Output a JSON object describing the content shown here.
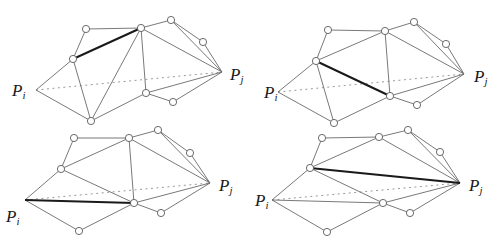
{
  "diagram": {
    "labels": {
      "start": {
        "main": "P",
        "sub": "i"
      },
      "end": {
        "main": "P",
        "sub": "j"
      }
    },
    "colors": {
      "edge": "#6a6a6a",
      "highlight_edge": "#1a1a1a",
      "dotted_segment": "#9a9a9a",
      "vertex_fill": "#ffffff",
      "vertex_stroke": "#5a5a5a"
    },
    "panels": [
      {
        "id": "panel-top-left",
        "nodes": {
          "Pi": [
            36,
            90
          ],
          "Pj": [
            222,
            72
          ],
          "A": [
            86,
            29
          ],
          "B": [
            141,
            28
          ],
          "C": [
            73,
            59
          ],
          "D": [
            171,
            20
          ],
          "E": [
            203,
            42
          ],
          "F": [
            146,
            93
          ],
          "G": [
            173,
            102
          ],
          "H": [
            91,
            121
          ]
        },
        "circled": [
          "A",
          "B",
          "C",
          "D",
          "E",
          "F",
          "G",
          "H"
        ],
        "edges": [
          [
            "Pi",
            "C"
          ],
          [
            "Pi",
            "H"
          ],
          [
            "C",
            "A"
          ],
          [
            "A",
            "B"
          ],
          [
            "C",
            "H"
          ],
          [
            "H",
            "B"
          ],
          [
            "H",
            "F"
          ],
          [
            "B",
            "F"
          ],
          [
            "B",
            "D"
          ],
          [
            "B",
            "Pj"
          ],
          [
            "D",
            "E"
          ],
          [
            "D",
            "Pj"
          ],
          [
            "E",
            "Pj"
          ],
          [
            "F",
            "Pj"
          ],
          [
            "F",
            "G"
          ],
          [
            "G",
            "Pj"
          ]
        ],
        "bold_edges": [
          [
            "C",
            "B"
          ]
        ],
        "dotted": [
          "Pi",
          "Pj"
        ],
        "label_pos": {
          "Pi": [
            12,
            96
          ],
          "Pj": [
            230,
            80
          ]
        }
      },
      {
        "id": "panel-top-right",
        "nodes": {
          "Pi": [
            278,
            92
          ],
          "Pj": [
            464,
            74
          ],
          "A": [
            328,
            30
          ],
          "B": [
            385,
            31
          ],
          "C": [
            316,
            61
          ],
          "D": [
            414,
            22
          ],
          "E": [
            446,
            44
          ],
          "F": [
            390,
            96
          ],
          "G": [
            417,
            105
          ],
          "H": [
            334,
            123
          ]
        },
        "circled": [
          "A",
          "B",
          "C",
          "D",
          "E",
          "F",
          "G",
          "H"
        ],
        "edges": [
          [
            "Pi",
            "C"
          ],
          [
            "Pi",
            "H"
          ],
          [
            "C",
            "A"
          ],
          [
            "A",
            "B"
          ],
          [
            "C",
            "B"
          ],
          [
            "C",
            "H"
          ],
          [
            "H",
            "F"
          ],
          [
            "B",
            "F"
          ],
          [
            "B",
            "D"
          ],
          [
            "B",
            "Pj"
          ],
          [
            "D",
            "E"
          ],
          [
            "D",
            "Pj"
          ],
          [
            "E",
            "Pj"
          ],
          [
            "F",
            "Pj"
          ],
          [
            "F",
            "G"
          ],
          [
            "G",
            "Pj"
          ]
        ],
        "bold_edges": [
          [
            "C",
            "F"
          ]
        ],
        "dotted": [
          "Pi",
          "Pj"
        ],
        "label_pos": {
          "Pi": [
            264,
            98
          ],
          "Pj": [
            474,
            82
          ]
        }
      },
      {
        "id": "panel-bottom-left",
        "nodes": {
          "Pi": [
            25,
            200
          ],
          "Pj": [
            210,
            183
          ],
          "A": [
            74,
            138
          ],
          "B": [
            129,
            138
          ],
          "C": [
            61,
            169
          ],
          "D": [
            158,
            130
          ],
          "E": [
            190,
            153
          ],
          "F": [
            134,
            203
          ],
          "G": [
            161,
            213
          ],
          "H": [
            79,
            231
          ]
        },
        "circled": [
          "A",
          "B",
          "C",
          "D",
          "E",
          "F",
          "G",
          "H"
        ],
        "edges": [
          [
            "Pi",
            "C"
          ],
          [
            "Pi",
            "H"
          ],
          [
            "C",
            "A"
          ],
          [
            "A",
            "B"
          ],
          [
            "C",
            "B"
          ],
          [
            "C",
            "F"
          ],
          [
            "H",
            "F"
          ],
          [
            "B",
            "F"
          ],
          [
            "B",
            "D"
          ],
          [
            "B",
            "Pj"
          ],
          [
            "D",
            "E"
          ],
          [
            "D",
            "Pj"
          ],
          [
            "E",
            "Pj"
          ],
          [
            "F",
            "Pj"
          ],
          [
            "F",
            "G"
          ],
          [
            "G",
            "Pj"
          ]
        ],
        "bold_edges": [
          [
            "Pi",
            "F"
          ]
        ],
        "dotted": [
          "Pi",
          "Pj"
        ],
        "label_pos": {
          "Pi": [
            6,
            222
          ],
          "Pj": [
            219,
            191
          ]
        }
      },
      {
        "id": "panel-bottom-right",
        "nodes": {
          "Pi": [
            272,
            200
          ],
          "Pj": [
            460,
            183
          ],
          "A": [
            322,
            138
          ],
          "B": [
            379,
            137
          ],
          "C": [
            310,
            168
          ],
          "D": [
            408,
            130
          ],
          "E": [
            440,
            152
          ],
          "F": [
            383,
            203
          ],
          "G": [
            410,
            213
          ],
          "H": [
            327,
            232
          ]
        },
        "circled": [
          "A",
          "B",
          "C",
          "D",
          "E",
          "F",
          "G",
          "H"
        ],
        "edges": [
          [
            "Pi",
            "C"
          ],
          [
            "Pi",
            "H"
          ],
          [
            "Pi",
            "F"
          ],
          [
            "C",
            "A"
          ],
          [
            "A",
            "B"
          ],
          [
            "C",
            "B"
          ],
          [
            "C",
            "F"
          ],
          [
            "H",
            "F"
          ],
          [
            "B",
            "D"
          ],
          [
            "B",
            "Pj"
          ],
          [
            "D",
            "E"
          ],
          [
            "D",
            "Pj"
          ],
          [
            "E",
            "Pj"
          ],
          [
            "F",
            "Pj"
          ],
          [
            "F",
            "G"
          ],
          [
            "G",
            "Pj"
          ]
        ],
        "bold_edges": [
          [
            "C",
            "Pj"
          ]
        ],
        "dotted": [
          "Pi",
          "Pj"
        ],
        "label_pos": {
          "Pi": [
            255,
            206
          ],
          "Pj": [
            469,
            191
          ]
        }
      }
    ]
  }
}
